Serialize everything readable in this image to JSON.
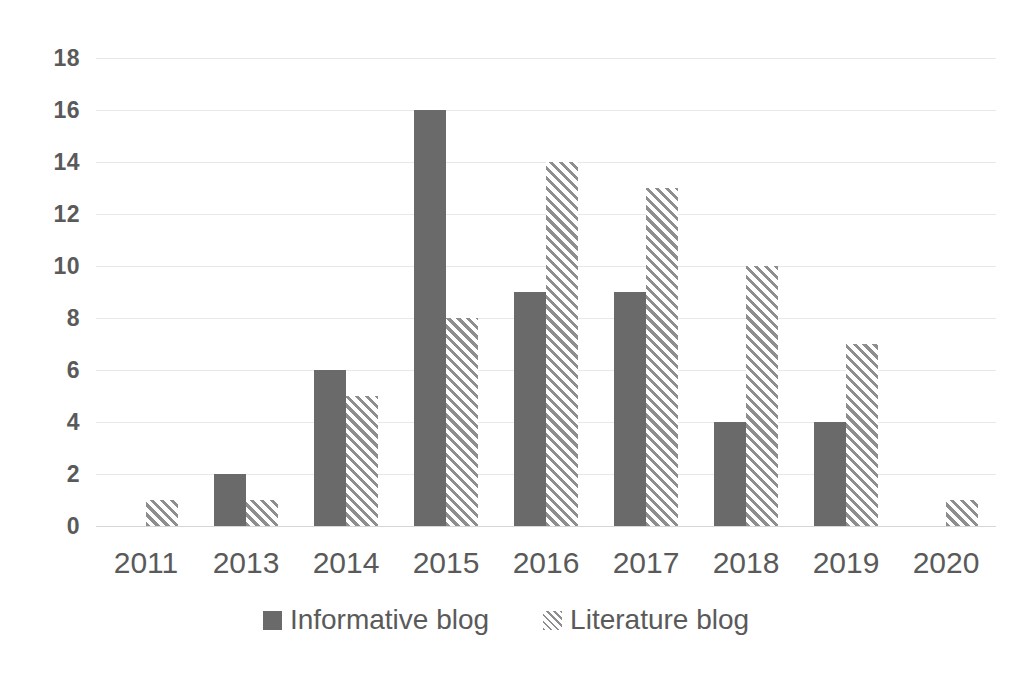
{
  "chart_data": {
    "type": "bar",
    "title": "",
    "subtitle": "",
    "xlabel": "",
    "ylabel": "",
    "categories": [
      "2011",
      "2013",
      "2014",
      "2015",
      "2016",
      "2017",
      "2018",
      "2019",
      "2020"
    ],
    "series": [
      {
        "name": "Informative blog",
        "style": "solid",
        "color": "#6a6a6a",
        "values": [
          0,
          2,
          6,
          16,
          9,
          9,
          4,
          4,
          0
        ]
      },
      {
        "name": "Literature blog",
        "style": "diagonal-hatch",
        "color": "#8e8e8e",
        "values": [
          1,
          1,
          5,
          8,
          14,
          13,
          10,
          7,
          1
        ]
      }
    ],
    "ylim": [
      0,
      18
    ],
    "y_ticks": [
      0,
      2,
      4,
      6,
      8,
      10,
      12,
      14,
      16,
      18
    ],
    "y_tick_labels": [
      "0",
      "2",
      "4",
      "6",
      "8",
      "10",
      "12",
      "14",
      "16",
      "18"
    ],
    "grid": true,
    "grid_axis": "y",
    "legend_position": "bottom",
    "background": "#ffffff",
    "axis_text_color": "#5a5a5a",
    "gridline_color": "#e8e8e8"
  },
  "legend": {
    "items": [
      {
        "label": "Informative blog",
        "swatch": "solid-square-swatch"
      },
      {
        "label": "Literature blog",
        "swatch": "hatched-square-swatch"
      }
    ]
  },
  "y_axis": {
    "labels": [
      "18",
      "16",
      "14",
      "12",
      "10",
      "8",
      "6",
      "4",
      "2",
      "0"
    ]
  },
  "x_axis": {
    "labels": [
      "2011",
      "2013",
      "2014",
      "2015",
      "2016",
      "2017",
      "2018",
      "2019",
      "2020"
    ]
  }
}
